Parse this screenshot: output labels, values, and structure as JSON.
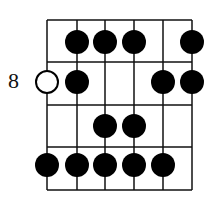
{
  "diagram": {
    "fret_label": "8",
    "strings": 6,
    "frets_shown": 4,
    "colors": {
      "line": "#111111",
      "dot": "#000000",
      "open_dot_fill": "#ffffff"
    },
    "dots": [
      {
        "fret_row": 1,
        "string": 2,
        "type": "filled"
      },
      {
        "fret_row": 1,
        "string": 3,
        "type": "filled"
      },
      {
        "fret_row": 1,
        "string": 4,
        "type": "filled"
      },
      {
        "fret_row": 1,
        "string": 6,
        "type": "filled"
      },
      {
        "fret_row": 2,
        "string": 1,
        "type": "open"
      },
      {
        "fret_row": 2,
        "string": 2,
        "type": "filled"
      },
      {
        "fret_row": 2,
        "string": 5,
        "type": "filled"
      },
      {
        "fret_row": 2,
        "string": 6,
        "type": "filled"
      },
      {
        "fret_row": 3,
        "string": 3,
        "type": "filled"
      },
      {
        "fret_row": 3,
        "string": 4,
        "type": "filled"
      },
      {
        "fret_row": 4,
        "string": 1,
        "type": "filled"
      },
      {
        "fret_row": 4,
        "string": 2,
        "type": "filled"
      },
      {
        "fret_row": 4,
        "string": 3,
        "type": "filled"
      },
      {
        "fret_row": 4,
        "string": 4,
        "type": "filled"
      },
      {
        "fret_row": 4,
        "string": 5,
        "type": "filled"
      }
    ]
  }
}
